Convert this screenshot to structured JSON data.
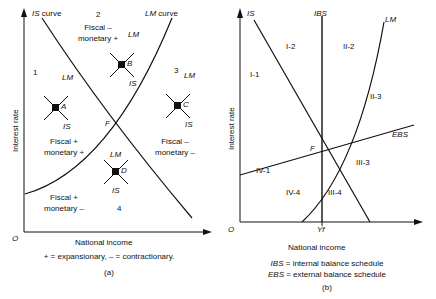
{
  "figure": {
    "panel_a": {
      "id": "(a)",
      "axis": {
        "y_label": "Interest rate",
        "x_label": "National income",
        "origin_label": "O"
      },
      "curves": [
        {
          "name": "IS curve",
          "label": "IS curve",
          "italic_part": "IS",
          "roman_part": " curve"
        },
        {
          "name": "LM curve",
          "label": "LM curve",
          "italic_part": "LM",
          "roman_part": " curve"
        }
      ],
      "intersection_label": "F",
      "zones": [
        {
          "number": "1",
          "line1": "Fiscal +",
          "line2": "monetary +"
        },
        {
          "number": "2",
          "line1": "Fiscal –",
          "line2": "monetary +"
        },
        {
          "number": "3",
          "line1": "Fiscal –",
          "line2": "monetary –"
        },
        {
          "number": "4",
          "line1": "Fiscal +",
          "line2": "monetary –"
        }
      ],
      "zone_numbers": {
        "z1": "1",
        "z2": "2",
        "z3": "3",
        "z4": "4"
      },
      "points": [
        {
          "label": "A",
          "lm": "LM",
          "is": "IS"
        },
        {
          "label": "B",
          "lm": "LM",
          "is": "IS"
        },
        {
          "label": "C",
          "lm": "LM",
          "is": "IS"
        },
        {
          "label": "D",
          "lm": "LM",
          "is": "IS"
        }
      ],
      "point_a": {
        "label": "A",
        "lm": "LM",
        "is": "IS"
      },
      "point_b": {
        "label": "B",
        "lm": "LM",
        "is": "IS"
      },
      "point_c": {
        "label": "C",
        "lm": "LM",
        "is": "IS"
      },
      "point_d": {
        "label": "D",
        "lm": "LM",
        "is": "IS"
      },
      "note": "+ = expansionary, – = contractionary."
    },
    "panel_b": {
      "id": "(b)",
      "axis": {
        "y_label": "Interest rate",
        "x_label": "National income",
        "origin_label": "O",
        "x_tick_label": "Yf"
      },
      "curve_labels": {
        "is": "IS",
        "ibs": "IBS",
        "lm": "LM",
        "ebs": "EBS"
      },
      "intersection_label": "F",
      "regions": [
        {
          "label": "I-1"
        },
        {
          "label": "I-2"
        },
        {
          "label": "II-2"
        },
        {
          "label": "II-3"
        },
        {
          "label": "III-3"
        },
        {
          "label": "III-4"
        },
        {
          "label": "IV-4"
        },
        {
          "label": "IV-1"
        }
      ],
      "region_labels": {
        "r_i_1": "I-1",
        "r_i_2": "I-2",
        "r_ii_2": "II-2",
        "r_ii_3": "II-3",
        "r_iii_3": "III-3",
        "r_iii_4": "III-4",
        "r_iv_4": "IV-4",
        "r_iv_1": "IV-1"
      },
      "legend": {
        "ibs_abbr": "IBS",
        "ibs_text": " = internal balance schedule",
        "ebs_abbr": "EBS",
        "ebs_text": " = external balance schedule"
      }
    },
    "colors": {
      "ink": "#101010",
      "background": "#ffffff"
    }
  }
}
